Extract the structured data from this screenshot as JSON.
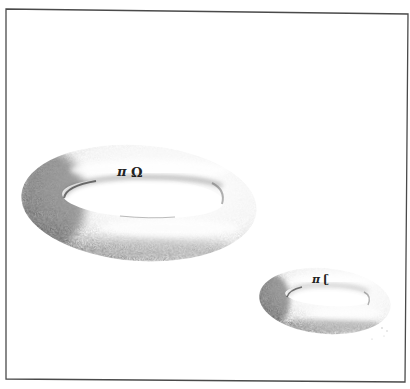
{
  "figure": {
    "type": "illustration",
    "frame": {
      "stroke": "#4a4a4a",
      "background": "#ffffff"
    },
    "shapes": [
      {
        "id": "large-torus",
        "label_symbols": [
          "π",
          "Ω̣"
        ],
        "label": "π Ω",
        "shading": "#2a2a2a"
      },
      {
        "id": "small-torus",
        "label_symbols": [
          "π",
          "C"
        ],
        "label": "π C",
        "shading": "#2a2a2a"
      }
    ]
  },
  "labels": {
    "large_pi": "π",
    "large_omega": "Ω",
    "small_pi": "π",
    "small_c": "ʗ"
  }
}
